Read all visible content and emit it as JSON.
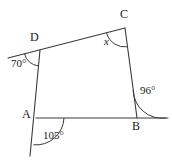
{
  "figure": {
    "type": "geometry-diagram",
    "stroke_color": "#3a3a3a",
    "text_color": "#1a1a1a",
    "background": "#ffffff",
    "width": 172,
    "height": 163
  },
  "vertices": [
    {
      "name": "A",
      "label": "A",
      "x": 36,
      "y": 118,
      "label_x": 22,
      "label_y": 110
    },
    {
      "name": "B",
      "label": "B",
      "x": 137,
      "y": 118,
      "label_x": 133,
      "label_y": 121
    },
    {
      "name": "C",
      "label": "C",
      "x": 125,
      "y": 28,
      "label_x": 121,
      "label_y": 10
    },
    {
      "name": "D",
      "label": "D",
      "x": 40,
      "y": 50,
      "label_x": 31,
      "label_y": 33
    }
  ],
  "angles": [
    {
      "name": "angle-at-D",
      "label": "70°",
      "vertex": "D",
      "value": 70,
      "label_x": 12,
      "label_y": 60
    },
    {
      "name": "angle-at-C",
      "label": "x",
      "vertex": "C",
      "value": null,
      "unknown": true,
      "label_x": 105,
      "label_y": 38
    },
    {
      "name": "angle-at-B",
      "label": "96°",
      "vertex": "B",
      "value": 96,
      "label_x": 141,
      "label_y": 87
    },
    {
      "name": "angle-at-A",
      "label": "105°",
      "vertex": "A",
      "value": 105,
      "label_x": 44,
      "label_y": 131
    }
  ],
  "segments": [
    {
      "name": "side-DC",
      "from": "D",
      "to": "C"
    },
    {
      "name": "side-CB",
      "from": "C",
      "to": "B"
    },
    {
      "name": "side-BA",
      "from": "B",
      "to": "A"
    },
    {
      "name": "side-AD",
      "from": "A",
      "to": "D"
    },
    {
      "name": "extension-beyond-D",
      "from": "D",
      "to": "left-edge"
    },
    {
      "name": "extension-beyond-B",
      "from": "B",
      "to": "right-edge"
    },
    {
      "name": "extension-below-A",
      "from": "A",
      "to": "bottom-edge"
    }
  ]
}
